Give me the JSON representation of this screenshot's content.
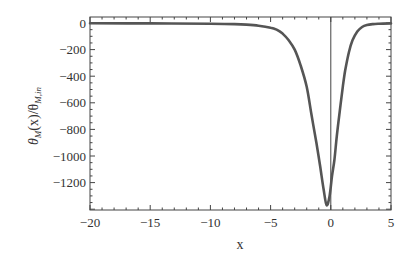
{
  "chart_data": {
    "type": "line",
    "title": "",
    "xlabel": "x",
    "ylabel": "θ_M(x)/θ_M,in",
    "ylabel_parts": {
      "theta": "θ",
      "sub1": "M",
      "mid": "(x)/θ",
      "sub2": "M,in"
    },
    "xlim": [
      -20,
      5
    ],
    "ylim": [
      -1410,
      40
    ],
    "grid": false,
    "legend": null,
    "x_ticks": [
      -20,
      -15,
      -10,
      -5,
      0,
      5
    ],
    "x_tick_labels": [
      "−20",
      "−15",
      "−10",
      "−5",
      "0",
      "5"
    ],
    "y_ticks": [
      0,
      -200,
      -400,
      -600,
      -800,
      -1000,
      -1200
    ],
    "y_tick_labels": [
      "0",
      "−200",
      "−400",
      "−600",
      "−800",
      "−1000",
      "−1200"
    ],
    "vertical_reference_line_x": 0,
    "line_color": "#555555",
    "series": [
      {
        "name": "θ_M(x)/θ_M,in",
        "x": [
          -20,
          -15,
          -10,
          -8,
          -7,
          -6,
          -5,
          -4.5,
          -4,
          -3.5,
          -3,
          -2.5,
          -2,
          -1.6,
          -1.2,
          -0.9,
          -0.6,
          -0.35,
          -0.1,
          0.1,
          0.3,
          0.5,
          0.75,
          1.0,
          1.2,
          1.5,
          1.8,
          2.2,
          2.6,
          3.0,
          3.5,
          4.0,
          5.0
        ],
        "y": [
          -2,
          -3,
          -5,
          -8,
          -12,
          -20,
          -35,
          -50,
          -80,
          -130,
          -200,
          -320,
          -480,
          -690,
          -900,
          -1070,
          -1250,
          -1370,
          -1300,
          -1150,
          -1030,
          -850,
          -660,
          -480,
          -355,
          -220,
          -130,
          -65,
          -30,
          -15,
          -8,
          -5,
          -3
        ]
      }
    ]
  }
}
